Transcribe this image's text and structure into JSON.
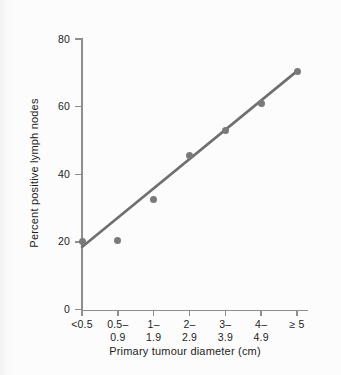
{
  "chart_data": {
    "type": "scatter",
    "title": "",
    "xlabel": "Primary tumour diameter (cm)",
    "ylabel": "Percent positive lymph nodes",
    "categories": [
      "<0.5",
      "0.5–\n0.9",
      "1–\n1.9",
      "2–\n2.9",
      "3–\n3.9",
      "4–\n4.9",
      "≥ 5"
    ],
    "category_lines": [
      {
        "line1": "<0.5",
        "line2": ""
      },
      {
        "line1": "0.5–",
        "line2": "0.9"
      },
      {
        "line1": "1–",
        "line2": "1.9"
      },
      {
        "line1": "2–",
        "line2": "2.9"
      },
      {
        "line1": "3–",
        "line2": "3.9"
      },
      {
        "line1": "4–",
        "line2": "4.9"
      },
      {
        "line1": "≥ 5",
        "line2": ""
      }
    ],
    "values": [
      20,
      20.5,
      32.5,
      45.5,
      53,
      61,
      70.5
    ],
    "ylim": [
      0,
      80
    ],
    "yticks": [
      0,
      20,
      40,
      60,
      80
    ],
    "ytick_labels": [
      "0",
      "20",
      "40",
      "60",
      "80"
    ],
    "grid": false,
    "legend": "none",
    "marker_color": "#7a7a7a",
    "line_color": "#6f6f6f",
    "axis_color": "#8e8e8e",
    "trendline": {
      "label": "fitted regression line",
      "start": {
        "category_index": 0,
        "value": 18.5
      },
      "end": {
        "category_index": 6,
        "value": 70.5
      }
    }
  }
}
